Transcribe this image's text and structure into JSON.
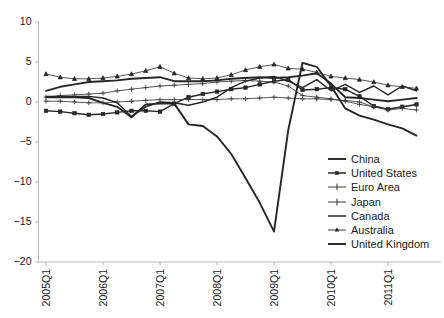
{
  "chart_data": {
    "type": "line",
    "title": "",
    "xlabel": "",
    "ylabel": "",
    "ylim": [
      -20,
      10
    ],
    "yticks": [
      10,
      5,
      0,
      -5,
      -10,
      -15,
      -20
    ],
    "ytick_labels": [
      "10",
      "5",
      "0",
      "−5",
      "−10",
      "−15",
      "−20"
    ],
    "grid": false,
    "legend_position": "lower-right",
    "x": [
      "2005Q1",
      "2005Q2",
      "2005Q3",
      "2005Q4",
      "2006Q1",
      "2006Q2",
      "2006Q3",
      "2006Q4",
      "2007Q1",
      "2007Q2",
      "2007Q3",
      "2007Q4",
      "2008Q1",
      "2008Q2",
      "2008Q3",
      "2008Q4",
      "2009Q1",
      "2009Q2",
      "2009Q3",
      "2009Q4",
      "2010Q1",
      "2010Q2",
      "2010Q3",
      "2010Q4",
      "2011Q1",
      "2011Q2",
      "2011Q3"
    ],
    "xtick_labels": [
      "2005Q1",
      "2006Q1",
      "2007Q1",
      "2008Q1",
      "2009Q1",
      "2010Q1",
      "2011Q1"
    ],
    "xtick_indices": [
      0,
      4,
      8,
      12,
      16,
      20,
      24
    ],
    "series": [
      {
        "name": "China",
        "marker": "none",
        "width": "thick",
        "values": [
          1.4,
          1.9,
          2.2,
          2.5,
          2.6,
          2.7,
          2.9,
          3.0,
          3.1,
          2.6,
          2.6,
          2.6,
          2.7,
          2.9,
          3.0,
          3.1,
          3.0,
          3.1,
          3.3,
          3.6,
          2.3,
          0.6,
          0.5,
          0.3,
          0.1,
          0.3,
          0.5
        ]
      },
      {
        "name": "United States",
        "marker": "square",
        "width": "medium",
        "values": [
          -1.1,
          -1.2,
          -1.4,
          -1.6,
          -1.5,
          -1.3,
          -1.1,
          -1.1,
          -1.2,
          -0.2,
          0.6,
          1.0,
          1.3,
          1.6,
          1.8,
          2.2,
          2.6,
          2.8,
          1.5,
          1.6,
          1.8,
          1.6,
          0.7,
          -0.5,
          -0.9,
          -0.6,
          -0.3
        ]
      },
      {
        "name": "Euro Area",
        "marker": "cross",
        "width": "thin",
        "values": [
          0.6,
          0.8,
          0.9,
          1.0,
          1.1,
          1.4,
          1.6,
          1.8,
          2.0,
          2.1,
          2.2,
          2.3,
          2.5,
          2.6,
          2.7,
          2.6,
          2.5,
          2.0,
          0.8,
          0.6,
          0.4,
          0.1,
          -0.3,
          -0.6,
          -0.9,
          -0.6,
          -0.4
        ]
      },
      {
        "name": "Japan",
        "marker": "plus",
        "width": "thin",
        "values": [
          0.1,
          0.1,
          0.0,
          -0.1,
          -0.1,
          0.0,
          0.1,
          0.2,
          0.3,
          0.3,
          0.3,
          0.3,
          0.3,
          0.4,
          0.4,
          0.5,
          0.6,
          0.5,
          0.4,
          0.4,
          0.3,
          0.2,
          0.0,
          -0.6,
          -1.0,
          -0.8,
          -1.0
        ]
      },
      {
        "name": "Canada",
        "marker": "none",
        "width": "medium",
        "values": [
          0.7,
          0.7,
          0.7,
          0.7,
          0.5,
          -0.1,
          -1.8,
          -0.6,
          0.0,
          -0.1,
          -0.4,
          0.0,
          0.6,
          1.8,
          2.6,
          3.0,
          3.2,
          2.6,
          1.8,
          2.8,
          1.4,
          2.2,
          1.2,
          2.0,
          0.9,
          2.0,
          1.4
        ]
      },
      {
        "name": "Australia",
        "marker": "triangle",
        "width": "thin",
        "values": [
          3.5,
          3.1,
          2.9,
          2.9,
          3.0,
          3.2,
          3.5,
          3.9,
          4.4,
          3.6,
          3.0,
          2.9,
          3.0,
          3.4,
          4.0,
          4.4,
          4.7,
          4.2,
          4.1,
          3.7,
          3.2,
          3.0,
          2.8,
          2.5,
          2.1,
          1.9,
          1.7
        ]
      },
      {
        "name": "United Kingdom",
        "marker": "none",
        "width": "thick",
        "values": [
          0.6,
          0.6,
          0.6,
          0.5,
          -0.1,
          -0.6,
          -1.9,
          -0.3,
          -0.2,
          -0.2,
          -2.8,
          -3.0,
          -4.3,
          -6.5,
          -9.5,
          -12.6,
          -16.2,
          -3.5,
          4.9,
          4.4,
          2.0,
          -0.8,
          -1.7,
          -2.2,
          -2.8,
          -3.3,
          -4.2
        ]
      }
    ]
  },
  "legend": {
    "entries": [
      {
        "label": "China",
        "marker": "none"
      },
      {
        "label": "United States",
        "marker": "square"
      },
      {
        "label": "Euro Area",
        "marker": "cross"
      },
      {
        "label": "Japan",
        "marker": "plus"
      },
      {
        "label": "Canada",
        "marker": "none"
      },
      {
        "label": "Australia",
        "marker": "triangle"
      },
      {
        "label": "United Kingdom",
        "marker": "none"
      }
    ]
  },
  "colors": {
    "line": "#262626",
    "axis": "#b8b8b8",
    "text": "#1a1a1a",
    "background": "#ffffff"
  }
}
